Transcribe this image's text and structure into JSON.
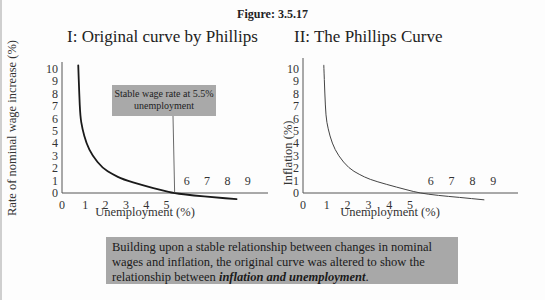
{
  "figure": {
    "title": "Figure: 3.5.17",
    "caption": {
      "text_before": "Building upon a stable relationship between changes in nominal wages and inflation, the original curve was altered to show the relationship between ",
      "emphasis": "inflation and unemployment",
      "text_after": "."
    }
  },
  "chart_data": [
    {
      "type": "line",
      "title": "I: Original curve by Phillips",
      "xlabel": "Unemployment (%)",
      "ylabel": "Rate of nominal wage increase (%)",
      "x_ticks": [
        "0",
        "1",
        "2",
        "3",
        "4",
        "5",
        "6",
        "7",
        "8",
        "9"
      ],
      "y_ticks": [
        "0",
        "1",
        "2",
        "3",
        "4",
        "5",
        "6",
        "7",
        "8",
        "9",
        "10"
      ],
      "xlim": [
        0,
        9.5
      ],
      "ylim": [
        0,
        10.5
      ],
      "grid": false,
      "series": [
        {
          "name": "Phillips curve",
          "x": [
            0.8,
            0.85,
            0.9,
            1.0,
            1.2,
            1.5,
            2.0,
            2.5,
            3.0,
            4.0,
            5.0,
            5.5,
            6.5,
            7.5,
            8.6
          ],
          "y": [
            10.3,
            8.0,
            6.2,
            5.2,
            4.0,
            3.0,
            2.0,
            1.5,
            1.1,
            0.6,
            0.2,
            0.0,
            -0.2,
            -0.35,
            -0.5
          ],
          "color": "#1a1a1a"
        }
      ],
      "annotations": [
        {
          "text": "Stable wage rate at 5.5% unemployment",
          "points_to": [
            5.5,
            0
          ]
        }
      ]
    },
    {
      "type": "line",
      "title": "II: The Phillips Curve",
      "xlabel": "Unemployment (%)",
      "ylabel": "Inflation (%)",
      "x_ticks": [
        "0",
        "1",
        "2",
        "3",
        "4",
        "5",
        "6",
        "7",
        "8",
        "9"
      ],
      "y_ticks": [
        "0",
        "1",
        "2",
        "3",
        "4",
        "5",
        "6",
        "7",
        "8",
        "9",
        "10"
      ],
      "xlim": [
        0,
        9.5
      ],
      "ylim": [
        0,
        10.5
      ],
      "grid": false,
      "series": [
        {
          "name": "Phillips curve",
          "x": [
            1.0,
            1.05,
            1.1,
            1.2,
            1.4,
            1.7,
            2.2,
            2.7,
            3.2,
            4.0,
            5.0,
            5.6,
            6.5,
            7.5,
            8.7
          ],
          "y": [
            10.3,
            8.0,
            6.2,
            5.2,
            4.0,
            3.0,
            2.0,
            1.5,
            1.1,
            0.7,
            0.25,
            0.0,
            -0.2,
            -0.35,
            -0.55
          ],
          "color": "#444444"
        }
      ]
    }
  ]
}
